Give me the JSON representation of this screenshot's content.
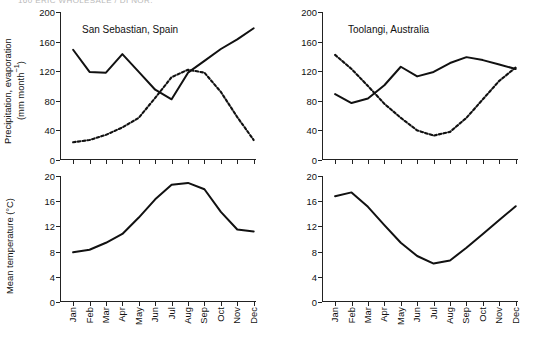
{
  "running_head": "160     ERIC WHOLESALE / DI  NOR.",
  "axis_titles": {
    "precipitation": "Precipitation, evaporation\n(mm month⁻¹)",
    "temperature": "Mean temperature (°C)"
  },
  "months": [
    "Jan",
    "Feb",
    "Mar",
    "Apr",
    "May",
    "Jun",
    "Jul",
    "Aug",
    "Sep",
    "Oct",
    "Nov",
    "Dec"
  ],
  "precip_ticks": [
    "0",
    "40",
    "80",
    "120",
    "160",
    "200"
  ],
  "temp_ticks": [
    "0",
    "4",
    "8",
    "12",
    "16",
    "20"
  ],
  "colors": {
    "line": "#111111",
    "axis": "#222222",
    "text": "#111111"
  },
  "chart_data": [
    {
      "type": "line",
      "title": "San Sebastian, Spain",
      "panel": "top-left",
      "xlabel": "",
      "ylabel": "Precipitation, evaporation (mm month⁻¹)",
      "ylim": [
        0,
        200
      ],
      "ytick_values": [
        0,
        40,
        80,
        120,
        160,
        200
      ],
      "grid": false,
      "legend": "none",
      "categories": [
        "Jan",
        "Feb",
        "Mar",
        "Apr",
        "May",
        "Jun",
        "Jul",
        "Aug",
        "Sep",
        "Oct",
        "Nov",
        "Dec"
      ],
      "series": [
        {
          "name": "Precipitation",
          "style": "solid",
          "values": [
            149,
            119,
            118,
            143,
            119,
            95,
            82,
            118,
            134,
            150,
            163,
            178
          ]
        },
        {
          "name": "Evaporation",
          "style": "dashed",
          "values": [
            24,
            27,
            34,
            44,
            57,
            84,
            112,
            122,
            118,
            92,
            58,
            27
          ]
        }
      ]
    },
    {
      "type": "line",
      "title": "Toolangi, Australia",
      "panel": "top-right",
      "xlabel": "",
      "ylabel": "Precipitation, evaporation (mm month⁻¹)",
      "ylim": [
        0,
        200
      ],
      "ytick_values": [
        0,
        40,
        80,
        120,
        160,
        200
      ],
      "grid": false,
      "legend": "none",
      "categories": [
        "Jan",
        "Feb",
        "Mar",
        "Apr",
        "May",
        "Jun",
        "Jul",
        "Aug",
        "Sep",
        "Oct",
        "Nov",
        "Dec"
      ],
      "series": [
        {
          "name": "Precipitation",
          "style": "solid",
          "values": [
            89,
            77,
            83,
            101,
            126,
            113,
            119,
            131,
            139,
            135,
            129,
            123
          ]
        },
        {
          "name": "Evaporation",
          "style": "dashed",
          "values": [
            142,
            123,
            100,
            76,
            57,
            40,
            33,
            38,
            57,
            82,
            107,
            125
          ]
        }
      ]
    },
    {
      "type": "line",
      "title": "",
      "panel": "bottom-left",
      "xlabel": "",
      "ylabel": "Mean temperature (°C)",
      "ylim": [
        0,
        20
      ],
      "ytick_values": [
        0,
        4,
        8,
        12,
        16,
        20
      ],
      "grid": false,
      "legend": "none",
      "categories": [
        "Jan",
        "Feb",
        "Mar",
        "Apr",
        "May",
        "Jun",
        "Jul",
        "Aug",
        "Sep",
        "Oct",
        "Nov",
        "Dec"
      ],
      "series": [
        {
          "name": "Mean temperature",
          "style": "solid",
          "values": [
            7.9,
            8.3,
            9.4,
            10.8,
            13.4,
            16.3,
            18.6,
            18.9,
            17.9,
            14.3,
            11.5,
            11.2
          ]
        }
      ]
    },
    {
      "type": "line",
      "title": "",
      "panel": "bottom-right",
      "xlabel": "",
      "ylabel": "Mean temperature (°C)",
      "ylim": [
        0,
        20
      ],
      "ytick_values": [
        0,
        4,
        8,
        12,
        16,
        20
      ],
      "grid": false,
      "legend": "none",
      "categories": [
        "Jan",
        "Feb",
        "Mar",
        "Apr",
        "May",
        "Jun",
        "Jul",
        "Aug",
        "Sep",
        "Oct",
        "Nov",
        "Dec"
      ],
      "series": [
        {
          "name": "Mean temperature",
          "style": "solid",
          "values": [
            16.8,
            17.4,
            15.1,
            12.2,
            9.4,
            7.3,
            6.1,
            6.6,
            8.6,
            10.8,
            13.0,
            15.2
          ]
        }
      ]
    }
  ]
}
